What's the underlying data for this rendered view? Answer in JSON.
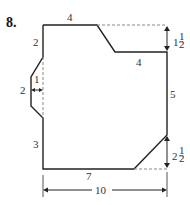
{
  "problem_number": "8.",
  "figure": {
    "stroke_color": "#222222",
    "dash_color": "#888888",
    "labels": {
      "top": "4",
      "left_upper": "2",
      "notch_depth": "1",
      "notch_height": "2",
      "left_lower": "3",
      "step_offset_whole": "1",
      "step_offset_frac": "1/2",
      "step_width": "4",
      "right": "5",
      "corner_cut_whole": "2",
      "corner_cut_frac": "1/2",
      "bottom": "7",
      "overall_width": "10"
    }
  }
}
